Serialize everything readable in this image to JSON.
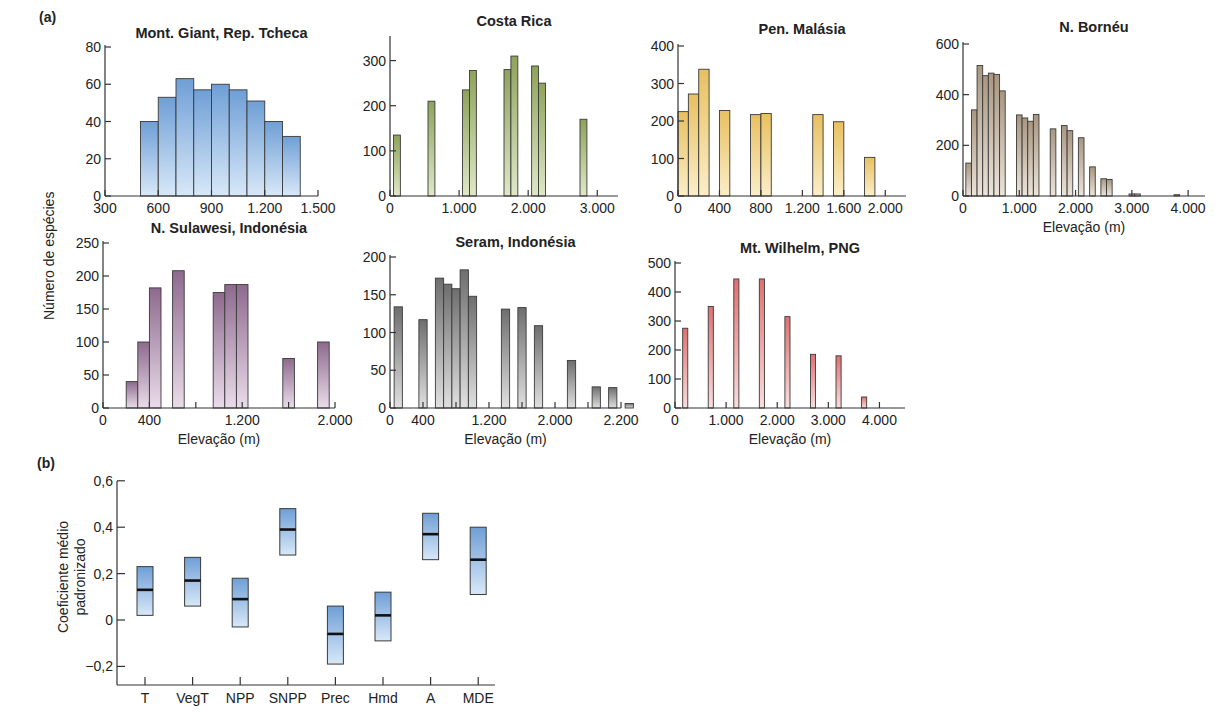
{
  "figure": {
    "panel_a_label": "(a)",
    "panel_b_label": "(b)",
    "ylabel_a": "Número de espécies",
    "ylabel_b_line1": "Coeficiente médio",
    "ylabel_b_line2": "padronizado",
    "xlabel": "Elevação (m)"
  },
  "chart_data": [
    {
      "type": "bar",
      "title": "Mont. Giant, Rep. Tcheca",
      "xlabel": "",
      "ylabel": "Número de espécies",
      "color": "#6f9fd6",
      "color_light": "#d8e8f8",
      "xlim": [
        300,
        1500
      ],
      "ylim": [
        0,
        80
      ],
      "xticks": [
        300,
        600,
        900,
        1200,
        1500
      ],
      "xtick_labels": [
        "300",
        "600",
        "900",
        "1.200",
        "1.500"
      ],
      "yticks": [
        0,
        20,
        40,
        60,
        80
      ],
      "bar_width": 100,
      "x": [
        550,
        650,
        750,
        850,
        950,
        1050,
        1150,
        1250,
        1350
      ],
      "values": [
        40,
        53,
        63,
        57,
        60,
        57,
        51,
        40,
        32
      ],
      "box": {
        "left": 105,
        "right": 318,
        "top": 47,
        "bottom": 196
      }
    },
    {
      "type": "bar",
      "title": "Costa Rica",
      "xlabel": "",
      "ylabel": "Número de espécies",
      "color": "#8ea35a",
      "color_light": "#dfe8c8",
      "xlim": [
        0,
        3300
      ],
      "ylim": [
        0,
        350
      ],
      "xticks": [
        0,
        1000,
        2000,
        3000
      ],
      "xtick_labels": [
        "0",
        "1.000",
        "2.000",
        "3.000"
      ],
      "yticks": [
        0,
        100,
        200,
        300
      ],
      "bar_width": 100,
      "x": [
        100,
        600,
        1100,
        1200,
        1700,
        1800,
        2100,
        2200,
        2800
      ],
      "values": [
        135,
        210,
        235,
        278,
        280,
        310,
        288,
        250,
        170
      ],
      "box": {
        "left": 390,
        "right": 618,
        "top": 38,
        "bottom": 196
      }
    },
    {
      "type": "bar",
      "title": "Pen. Malásia",
      "xlabel": "",
      "ylabel": "Número de espécies",
      "color": "#e8c060",
      "color_light": "#fbeec8",
      "xlim": [
        0,
        2200
      ],
      "ylim": [
        0,
        400
      ],
      "xticks": [
        0,
        400,
        800,
        1200,
        1600,
        2000
      ],
      "xtick_labels": [
        "0",
        "400",
        "800",
        "1.200",
        "1.600",
        "2.000"
      ],
      "yticks": [
        0,
        100,
        200,
        300,
        400
      ],
      "bar_width": 100,
      "x": [
        50,
        150,
        250,
        450,
        750,
        850,
        1350,
        1550,
        1850
      ],
      "values": [
        225,
        272,
        338,
        228,
        217,
        220,
        217,
        198,
        103
      ],
      "box": {
        "left": 678,
        "right": 906,
        "top": 46,
        "bottom": 196
      }
    },
    {
      "type": "bar",
      "title": "N. Bornéu",
      "xlabel": "Elevação (m)",
      "ylabel": "Número de espécies",
      "color": "#a89680",
      "color_light": "#ece4da",
      "xlim": [
        0,
        4300
      ],
      "ylim": [
        0,
        600
      ],
      "xticks": [
        0,
        1000,
        2000,
        3000,
        4000
      ],
      "xtick_labels": [
        "0",
        "1.000",
        "2.000",
        "3.000",
        "4.000"
      ],
      "yticks": [
        0,
        200,
        400,
        600
      ],
      "bar_width": 100,
      "x": [
        100,
        200,
        300,
        400,
        500,
        600,
        700,
        1000,
        1100,
        1200,
        1300,
        1600,
        1800,
        1900,
        2100,
        2300,
        2500,
        2600,
        3000,
        3100,
        3800
      ],
      "values": [
        130,
        340,
        515,
        475,
        485,
        480,
        415,
        320,
        308,
        295,
        322,
        265,
        278,
        258,
        230,
        115,
        68,
        65,
        8,
        8,
        5
      ],
      "box": {
        "left": 963,
        "right": 1205,
        "top": 44,
        "bottom": 196
      }
    },
    {
      "type": "bar",
      "title": "N. Sulawesi, Indonésia",
      "xlabel": "Elevação (m)",
      "ylabel": "Número de espécies",
      "color": "#8e6a8e",
      "color_light": "#eadcea",
      "xlim": [
        0,
        2000
      ],
      "ylim": [
        0,
        250
      ],
      "xticks": [
        0,
        400,
        800,
        1200,
        1600,
        2000
      ],
      "xtick_labels": [
        "0",
        "400",
        "",
        "1.200",
        "",
        "2.000"
      ],
      "yticks": [
        0,
        50,
        100,
        150,
        200,
        250
      ],
      "bar_width": 100,
      "x": [
        250,
        350,
        450,
        650,
        1000,
        1100,
        1200,
        1600,
        1900
      ],
      "values": [
        40,
        100,
        182,
        208,
        175,
        187,
        187,
        75,
        100
      ],
      "box": {
        "left": 103,
        "right": 335,
        "top": 243,
        "bottom": 408
      }
    },
    {
      "type": "bar",
      "title": "Seram, Indonésia",
      "xlabel": "Elevação (m)",
      "ylabel": "Número de espécies",
      "color": "#6e6e6e",
      "color_light": "#e0e0e0",
      "xlim": [
        0,
        2800
      ],
      "ylim": [
        0,
        200
      ],
      "xticks": [
        0,
        400,
        800,
        1200,
        1600,
        2000,
        2400,
        2800
      ],
      "xtick_labels": [
        "0",
        "400",
        "",
        "1.200",
        "",
        "2.000",
        "",
        "2.200"
      ],
      "yticks": [
        0,
        50,
        100,
        150,
        200
      ],
      "bar_width": 100,
      "x": [
        100,
        400,
        600,
        700,
        800,
        900,
        1000,
        1400,
        1600,
        1800,
        2200,
        2500,
        2700,
        2900
      ],
      "values": [
        134,
        117,
        172,
        164,
        158,
        183,
        148,
        131,
        133,
        109,
        63,
        28,
        27,
        6
      ],
      "box": {
        "left": 390,
        "right": 621,
        "top": 257,
        "bottom": 408
      }
    },
    {
      "type": "bar",
      "title": "Mt. Wilhelm, PNG",
      "xlabel": "Elevação (m)",
      "ylabel": "Número de espécies",
      "color": "#e07070",
      "color_light": "#fbdcdc",
      "xlim": [
        0,
        4500
      ],
      "ylim": [
        0,
        500
      ],
      "xticks": [
        0,
        1000,
        2000,
        3000,
        4000
      ],
      "xtick_labels": [
        "0",
        "1.000",
        "2.000",
        "3.000",
        "4.000"
      ],
      "yticks": [
        0,
        100,
        200,
        300,
        400,
        500
      ],
      "bar_width": 100,
      "x": [
        200,
        700,
        1200,
        1700,
        2200,
        2700,
        3200,
        3700
      ],
      "values": [
        275,
        350,
        445,
        445,
        315,
        185,
        180,
        38
      ],
      "box": {
        "left": 675,
        "right": 905,
        "top": 263,
        "bottom": 408
      }
    },
    {
      "type": "range",
      "title": "",
      "xlabel": "",
      "ylabel": "Coeficiente médio padronizado",
      "color": "#6f9fd6",
      "color_light": "#d8e8f8",
      "ylim": [
        -0.2,
        0.6
      ],
      "yticks": [
        -0.2,
        0,
        0.2,
        0.4,
        0.6
      ],
      "ytick_labels": [
        "−0,2",
        "0",
        "0,2",
        "0,4",
        "0,6"
      ],
      "categories": [
        "T",
        "VegT",
        "NPP",
        "SNPP",
        "Prec",
        "Hmd",
        "A",
        "MDE"
      ],
      "mean": [
        0.13,
        0.17,
        0.09,
        0.39,
        -0.06,
        0.02,
        0.37,
        0.26
      ],
      "low": [
        0.02,
        0.06,
        -0.03,
        0.28,
        -0.19,
        -0.09,
        0.26,
        0.11
      ],
      "high": [
        0.23,
        0.27,
        0.18,
        0.48,
        0.06,
        0.12,
        0.46,
        0.4
      ],
      "box": {
        "left": 117,
        "right": 495,
        "y0": 620,
        "yscale": 232,
        "bottom": 685,
        "top": 481
      }
    }
  ]
}
